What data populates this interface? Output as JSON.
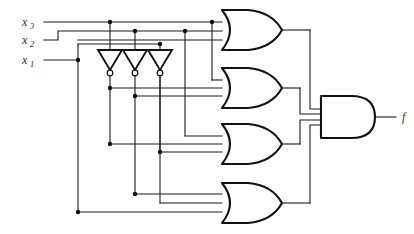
{
  "diagram": {
    "type": "logic-circuit",
    "background_color": "#ffffff",
    "wire_color": "#1a1a1a",
    "gate_fill": "#ffffff",
    "gate_stroke": "#111111"
  },
  "inputs": [
    {
      "id": "x3",
      "base": "x",
      "subscript": "3",
      "label": "x₃",
      "y": 22
    },
    {
      "id": "x2",
      "base": "x",
      "subscript": "2",
      "label": "x₂",
      "y": 40
    },
    {
      "id": "x1",
      "base": "x",
      "subscript": "1",
      "label": "x₁",
      "y": 60
    }
  ],
  "output": {
    "id": "f",
    "label": "f",
    "y": 117
  },
  "inverters": [
    {
      "id": "inv1",
      "input": "x3",
      "output": "x3_not",
      "x": 110,
      "y_top": 50,
      "y_bottom": 74
    },
    {
      "id": "inv2",
      "input": "x2",
      "output": "x2_not",
      "x": 135,
      "y_top": 50,
      "y_bottom": 74
    },
    {
      "id": "inv3",
      "input": "x1",
      "output": "x1_not",
      "x": 160,
      "y_top": 50,
      "y_bottom": 74
    }
  ],
  "or_gates": [
    {
      "id": "or1",
      "label": "OR",
      "num_inputs": 3,
      "center_y": 30,
      "input_signals": [
        "x3",
        "x2",
        "x1"
      ]
    },
    {
      "id": "or2",
      "label": "OR",
      "num_inputs": 3,
      "center_y": 88,
      "input_signals": [
        "x3",
        "x3_not",
        "x2_not"
      ]
    },
    {
      "id": "or3",
      "label": "OR",
      "num_inputs": 3,
      "center_y": 144,
      "input_signals": [
        "x3_not",
        "x2",
        "x1_not"
      ]
    },
    {
      "id": "or4",
      "label": "OR",
      "num_inputs": 3,
      "center_y": 203,
      "input_signals": [
        "x2_not",
        "x1_not",
        "x1"
      ]
    }
  ],
  "and_gate": {
    "id": "and1",
    "label": "AND",
    "num_inputs": 4,
    "center_y": 117,
    "input_signals": [
      "or1",
      "or2",
      "or3",
      "or4"
    ],
    "output_signal": "f"
  },
  "junction_count": 14
}
